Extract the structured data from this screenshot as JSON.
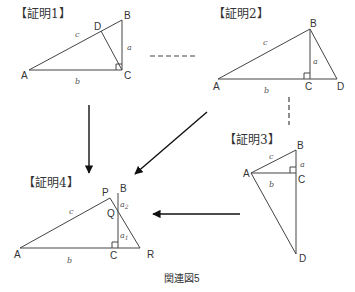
{
  "caption": "関連図5",
  "diagrams": [
    {
      "title": "【証明1】",
      "points": {
        "A": "A",
        "B": "B",
        "C": "C",
        "D": "D"
      },
      "sides": {
        "a": "a",
        "b": "b",
        "c": "c"
      }
    },
    {
      "title": "【証明2】",
      "points": {
        "A": "A",
        "B": "B",
        "C": "C",
        "D": "D"
      },
      "sides": {
        "a": "a",
        "b": "b",
        "c": "c"
      }
    },
    {
      "title": "【証明3】",
      "points": {
        "A": "A",
        "B": "B",
        "C": "C",
        "D": "D"
      },
      "sides": {
        "a": "a",
        "b": "b",
        "c": "c"
      }
    },
    {
      "title": "【証明4】",
      "points": {
        "A": "A",
        "B": "B",
        "C": "C",
        "P": "P",
        "Q": "Q",
        "R": "R"
      },
      "sides": {
        "b": "b",
        "c": "c",
        "a1": "a",
        "a1_sub": "1",
        "a2": "a",
        "a2_sub": "2"
      }
    }
  ],
  "connections": [
    {
      "from": "証明1",
      "to": "証明2",
      "style": "dashed"
    },
    {
      "from": "証明2",
      "to": "証明3",
      "style": "dashed"
    },
    {
      "from": "証明1",
      "to": "証明4",
      "style": "arrow"
    },
    {
      "from": "証明2",
      "to": "証明4",
      "style": "arrow"
    },
    {
      "from": "証明3",
      "to": "証明4",
      "style": "arrow"
    }
  ]
}
